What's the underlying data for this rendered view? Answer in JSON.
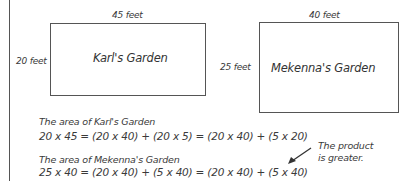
{
  "gardens": [
    {
      "name": "Karl's Garden",
      "top_label": "45 feet",
      "side_label": "20 feet"
    },
    {
      "name": "Mekenna's Garden",
      "top_label": "40 feet",
      "side_label": "25 feet"
    }
  ],
  "work": {
    "karl_heading": "The area of Karl's Garden",
    "karl_equation": "20 x 45 = (20 x 40) + (20 x 5) = (20 x 40) + (5 x 20)",
    "mekenna_heading": "The area of Mekenna's Garden",
    "mekenna_equation": "25 x 40 = (20 x 40) + (5 x 40) = (20 x 40) + (5 x 40)"
  },
  "note": {
    "line1": "The product",
    "line2": "is greater.",
    "arrow_icon": "arrow-down-left"
  }
}
